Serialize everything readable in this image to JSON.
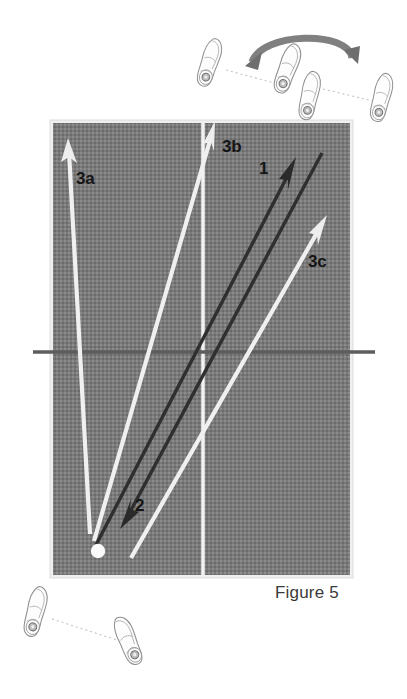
{
  "figure": {
    "caption": "Figure 5",
    "background_color": "#ffffff",
    "court_color": "#7a7a7a",
    "court_border_color": "#e8e8e8",
    "line_color": "#f2f2f2",
    "net_color": "#5d5d5d",
    "dark_arrow_color": "#2c2c2c",
    "light_arrow_color": "#f0f0f0",
    "ball_color": "#fafafa",
    "shoe_outline_color": "#8a8a8a",
    "dotted_path_color": "#b8b8b8",
    "curved_arrow_color": "#6a6a6a"
  },
  "court": {
    "x": 53,
    "y": 123,
    "width": 297,
    "height": 452,
    "center_line_x": 203,
    "net_line_y": 352,
    "net_line_x_start": 33,
    "net_line_x_end": 375
  },
  "labels": [
    {
      "id": "3a",
      "text": "3a",
      "x": 76,
      "y": 170,
      "arrow_kind": "light"
    },
    {
      "id": "3b",
      "text": "3b",
      "x": 222,
      "y": 138,
      "arrow_kind": "light"
    },
    {
      "id": "1",
      "text": "1",
      "x": 259,
      "y": 160,
      "arrow_kind": "dark"
    },
    {
      "id": "3c",
      "text": "3c",
      "x": 308,
      "y": 253,
      "arrow_kind": "light"
    },
    {
      "id": "2",
      "text": "2",
      "x": 135,
      "y": 497,
      "arrow_kind": "dark"
    }
  ],
  "arrows": [
    {
      "name": "arrow-3a",
      "label": "3a",
      "kind": "light",
      "from_x": 90,
      "from_y": 534,
      "to_x": 68,
      "to_y": 140
    },
    {
      "name": "arrow-3b",
      "label": "3b",
      "kind": "light",
      "from_x": 94,
      "from_y": 541,
      "to_x": 215,
      "to_y": 122
    },
    {
      "name": "arrow-1",
      "label": "1",
      "kind": "dark",
      "from_x": 96,
      "from_y": 543,
      "to_x": 295,
      "to_y": 158
    },
    {
      "name": "arrow-3c",
      "label": "3c",
      "kind": "light",
      "from_x": 131,
      "from_y": 558,
      "to_x": 326,
      "to_y": 216
    },
    {
      "name": "arrow-2",
      "label": "2",
      "kind": "dark",
      "from_x": 322,
      "from_y": 153,
      "to_x": 120,
      "to_y": 528
    }
  ],
  "ball": {
    "name": "shuttle-ball",
    "x": 98,
    "y": 551,
    "radius": 7
  },
  "shoes_top": [
    {
      "name": "shoe-top-1",
      "x": 210,
      "y": 62,
      "rotation": 12
    },
    {
      "name": "shoe-top-2",
      "x": 287,
      "y": 68,
      "rotation": 14
    },
    {
      "name": "shoe-top-3",
      "x": 309,
      "y": 94,
      "rotation": 6
    },
    {
      "name": "shoe-top-4",
      "x": 382,
      "y": 97,
      "rotation": 8
    }
  ],
  "shoes_bottom": [
    {
      "name": "shoe-bottom-1",
      "x": 36,
      "y": 611,
      "rotation": 8
    },
    {
      "name": "shoe-bottom-2",
      "x": 128,
      "y": 639,
      "rotation": -28
    }
  ],
  "dotted_paths_top": [
    {
      "name": "dotted-path-top-a",
      "x1": 226,
      "y1": 70,
      "x2": 283,
      "y2": 85
    },
    {
      "name": "dotted-path-top-b",
      "x1": 322,
      "y1": 88,
      "x2": 372,
      "y2": 100
    }
  ],
  "dotted_paths_bottom": [
    {
      "name": "dotted-path-bottom",
      "x1": 50,
      "y1": 618,
      "x2": 122,
      "y2": 640
    }
  ],
  "curved_arrow": {
    "name": "rotation-curved-arrow",
    "start_x": 248,
    "start_y": 63,
    "peak_x": 303,
    "peak_y": 31,
    "end_x": 356,
    "end_y": 60
  }
}
